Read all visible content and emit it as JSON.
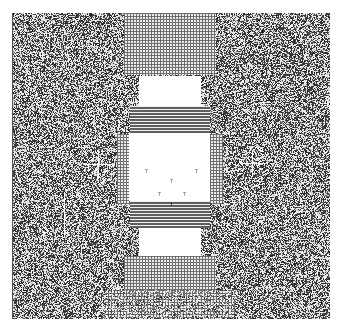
{
  "canvas": {
    "width": 338,
    "height": 327,
    "background": "#ffffff"
  },
  "pattern": {
    "noise_region": {
      "x": 12,
      "y": 13,
      "w": 318,
      "h": 306
    },
    "seed": 1337,
    "noise_dark": "#1a1a1a",
    "noise_light": "#f2f2f2",
    "noise_density": 0.5,
    "left_edge_line": {
      "x": 12,
      "y": 13,
      "h": 306,
      "color": "#555555"
    },
    "regions": [
      {
        "name": "top-grid-column",
        "type": "grid",
        "x": 124,
        "y": 13,
        "w": 92,
        "h": 62,
        "pitch": 3
      },
      {
        "name": "upper-white-block",
        "type": "white",
        "x": 139,
        "y": 76,
        "w": 62,
        "h": 30
      },
      {
        "name": "upper-stripes",
        "type": "hstripes",
        "x": 130,
        "y": 106,
        "w": 80,
        "h": 28,
        "pitch": 3
      },
      {
        "name": "center-grid-frame",
        "type": "grid",
        "x": 117,
        "y": 134,
        "w": 106,
        "h": 70,
        "pitch": 3
      },
      {
        "name": "center-white-block",
        "type": "white",
        "x": 129,
        "y": 133,
        "w": 81,
        "h": 68
      },
      {
        "name": "lower-stripes",
        "type": "hstripes",
        "x": 130,
        "y": 201,
        "w": 80,
        "h": 27,
        "pitch": 3
      },
      {
        "name": "lower-white-block",
        "type": "white",
        "x": 139,
        "y": 228,
        "w": 62,
        "h": 28
      },
      {
        "name": "bottom-grid-column",
        "type": "grid",
        "x": 124,
        "y": 256,
        "w": 92,
        "h": 40,
        "pitch": 3
      },
      {
        "name": "bottom-grid-band",
        "type": "grid",
        "x": 105,
        "y": 290,
        "w": 130,
        "h": 28,
        "pitch": 3,
        "mix": 0.35
      }
    ],
    "crosshairs": [
      {
        "x": 98,
        "y": 164,
        "size": 14
      },
      {
        "x": 252,
        "y": 163,
        "size": 12
      }
    ],
    "vertical_marks": [
      {
        "x": 64,
        "y": 192,
        "h": 30
      },
      {
        "x": 64,
        "y": 222,
        "h": 14
      }
    ],
    "center_marks": [
      {
        "x": 146,
        "y": 169
      },
      {
        "x": 196,
        "y": 169
      },
      {
        "x": 171,
        "y": 179
      },
      {
        "x": 159,
        "y": 192
      },
      {
        "x": 184,
        "y": 192
      }
    ],
    "center_tick": {
      "x": 171,
      "y": 202,
      "h": 4
    }
  }
}
